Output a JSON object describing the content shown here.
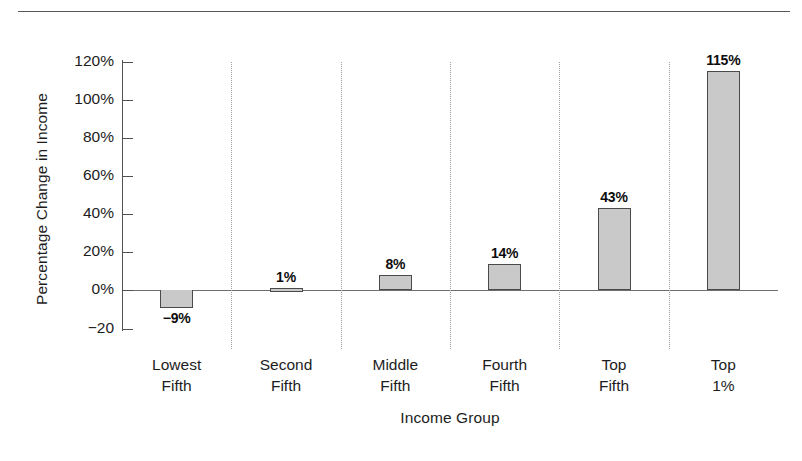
{
  "chart_data": {
    "type": "bar",
    "title": "",
    "xlabel": "Income Group",
    "ylabel": "Percentage Change in Income",
    "categories": [
      "Lowest Fifth",
      "Second Fifth",
      "Middle Fifth",
      "Fourth Fifth",
      "Top Fifth",
      "Top 1%"
    ],
    "category_lines": [
      [
        "Lowest",
        "Fifth"
      ],
      [
        "Second",
        "Fifth"
      ],
      [
        "Middle",
        "Fifth"
      ],
      [
        "Fourth",
        "Fifth"
      ],
      [
        "Top",
        "Fifth"
      ],
      [
        "Top",
        "1%"
      ]
    ],
    "values": [
      -9,
      1,
      8,
      14,
      43,
      115
    ],
    "data_labels": [
      "−9%",
      "1%",
      "8%",
      "14%",
      "43%",
      "115%"
    ],
    "ylim": [
      -20,
      130
    ],
    "yticks": [
      120,
      100,
      80,
      60,
      40,
      20,
      0,
      -20
    ],
    "ytick_labels": [
      "120%",
      "100%",
      "80%",
      "60%",
      "40%",
      "20%",
      "0%",
      "−20"
    ],
    "grid": "vertical-dotted-between-categories",
    "legend": "none",
    "bar_fill_color": "#c9c9c9",
    "bar_border_color": "#4a4a4a",
    "axis_color": "#4e5255",
    "gridline_color": "#9aa0a4"
  },
  "axes": {
    "y_title": "Percentage Change in Income",
    "x_title": "Income Group"
  },
  "ticks": {
    "y": [
      {
        "label": "120%",
        "value": 120
      },
      {
        "label": "100%",
        "value": 100
      },
      {
        "label": "80%",
        "value": 80
      },
      {
        "label": "60%",
        "value": 60
      },
      {
        "label": "40%",
        "value": 40
      },
      {
        "label": "20%",
        "value": 20
      },
      {
        "label": "0%",
        "value": 0
      },
      {
        "label": "−20",
        "value": -20
      }
    ]
  },
  "bars": [
    {
      "label": "−9%",
      "value": -9,
      "cat_line1": "Lowest",
      "cat_line2": "Fifth"
    },
    {
      "label": "1%",
      "value": 1,
      "cat_line1": "Second",
      "cat_line2": "Fifth"
    },
    {
      "label": "8%",
      "value": 8,
      "cat_line1": "Middle",
      "cat_line2": "Fifth"
    },
    {
      "label": "14%",
      "value": 14,
      "cat_line1": "Fourth",
      "cat_line2": "Fifth"
    },
    {
      "label": "43%",
      "value": 43,
      "cat_line1": "Top",
      "cat_line2": "Fifth"
    },
    {
      "label": "115%",
      "value": 115,
      "cat_line1": "Top",
      "cat_line2": "1%"
    }
  ]
}
